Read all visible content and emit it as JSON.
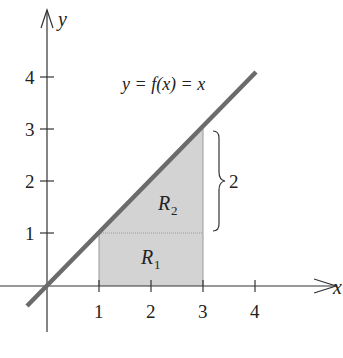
{
  "figure": {
    "axes": {
      "x_label": "x",
      "y_label": "y",
      "x_ticks": [
        "1",
        "2",
        "3",
        "4"
      ],
      "y_ticks": [
        "1",
        "2",
        "3",
        "4"
      ]
    },
    "function_label": "y = f(x) = x",
    "regions": {
      "r1": {
        "letter": "R",
        "subscript": "1"
      },
      "r2": {
        "letter": "R",
        "subscript": "2"
      }
    },
    "brace_label": "2",
    "colors": {
      "line": "#6b6b6b",
      "fill": "#d3d3d3",
      "axis": "#333333"
    }
  }
}
